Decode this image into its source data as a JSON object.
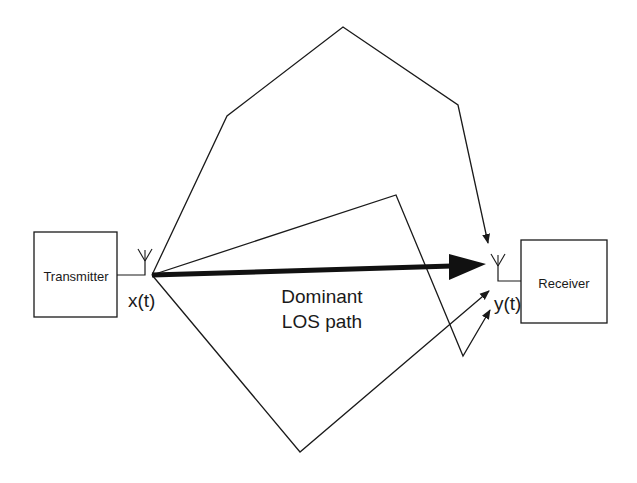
{
  "diagram": {
    "type": "multipath propagation diagram",
    "transmitter": {
      "label": "Transmitter",
      "signal_label": "x(t)"
    },
    "receiver": {
      "label": "Receiver",
      "signal_label": "y(t)"
    },
    "los_path": {
      "label_line1": "Dominant",
      "label_line2": "LOS path"
    },
    "colors": {
      "line": "#1a1a1a",
      "background": "#ffffff"
    },
    "paths": [
      {
        "name": "reflected-path-top",
        "points": [
          [
            152,
            275
          ],
          [
            227,
            116
          ],
          [
            343,
            27
          ],
          [
            458,
            105
          ],
          [
            488,
            243
          ]
        ]
      },
      {
        "name": "reflected-path-middle",
        "points": [
          [
            152,
            275
          ],
          [
            396,
            195
          ],
          [
            463,
            356
          ],
          [
            490,
            310
          ]
        ]
      },
      {
        "name": "reflected-path-bottom",
        "points": [
          [
            152,
            275
          ],
          [
            300,
            452
          ],
          [
            489,
            291
          ]
        ]
      }
    ]
  }
}
